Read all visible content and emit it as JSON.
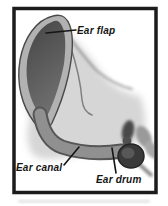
{
  "figure": {
    "type": "anatomy-diagram",
    "labels": {
      "ear_flap": "Ear flap",
      "ear_canal": "Ear canal",
      "ear_drum": "Ear drum"
    },
    "colors": {
      "frame": "#1c1c1c",
      "background": "#ffffff",
      "flap_dark_top": "#454545",
      "flap_dark_bottom": "#6e6e6e",
      "flap_rim": "#b2b2b2",
      "shading": "#cfcfcf",
      "canal_fill": "#909090",
      "canal_edge": "#565656",
      "drum": "#3a3a3a",
      "drum_petal_light": "#9a9a9a",
      "pointer": "#151515",
      "label_text": "#141414"
    }
  }
}
